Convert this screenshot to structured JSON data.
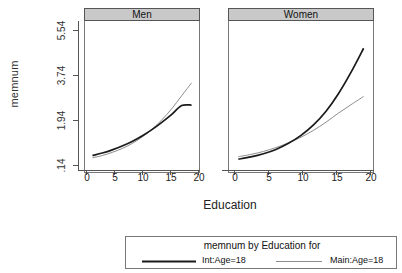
{
  "figure": {
    "ylabel": "memnum",
    "xlabel": "Education",
    "yticks": [
      ".14",
      "1.94",
      "3.74",
      "5.54"
    ],
    "xticks": [
      "0",
      "5",
      "10",
      "15",
      "20"
    ],
    "panels": [
      {
        "strip_label": "Men"
      },
      {
        "strip_label": "Women"
      }
    ]
  },
  "legend": {
    "title": "memnum by Education for",
    "entries": [
      {
        "label": "Int:Age=18",
        "color": "#1a1a1a",
        "width": 2.0
      },
      {
        "label": "Main:Age=18",
        "color": "#8c8c8c",
        "width": 1.0
      }
    ]
  },
  "chart_data": {
    "type": "line",
    "title": "memnum by Education for",
    "xlabel": "Education",
    "ylabel": "memnum",
    "xlim": [
      -1.5,
      21.5
    ],
    "ylim": [
      -0.3,
      6.3
    ],
    "yticks": [
      0.14,
      1.94,
      3.74,
      5.54
    ],
    "xticks": [
      0,
      5,
      10,
      15,
      20
    ],
    "grid": false,
    "legend_position": "bottom",
    "panels": [
      {
        "name": "Men",
        "x": [
          0,
          2,
          4,
          6,
          8,
          10,
          12,
          14,
          16,
          18,
          20
        ],
        "series": [
          {
            "name": "Int:Age=18",
            "color": "#1a1a1a",
            "values": [
              0.38,
              0.49,
              0.63,
              0.8,
              1.0,
              1.24,
              1.52,
              1.84,
              2.19,
              2.58,
              2.6
            ]
          },
          {
            "name": "Main:Age=18",
            "color": "#8c8c8c",
            "values": [
              0.28,
              0.38,
              0.52,
              0.69,
              0.91,
              1.19,
              1.53,
              1.95,
              2.44,
              3.01,
              3.58
            ]
          }
        ]
      },
      {
        "name": "Women",
        "x": [
          0,
          2,
          4,
          6,
          8,
          10,
          12,
          14,
          16,
          18,
          20
        ],
        "series": [
          {
            "name": "Int:Age=18",
            "color": "#1a1a1a",
            "values": [
              0.22,
              0.32,
              0.46,
              0.65,
              0.92,
              1.27,
              1.73,
              2.33,
              3.11,
              4.05,
              5.1
            ]
          },
          {
            "name": "Main:Age=18",
            "color": "#8c8c8c",
            "values": [
              0.33,
              0.43,
              0.56,
              0.73,
              0.94,
              1.19,
              1.49,
              1.85,
              2.25,
              2.62,
              2.98
            ]
          }
        ]
      }
    ]
  }
}
